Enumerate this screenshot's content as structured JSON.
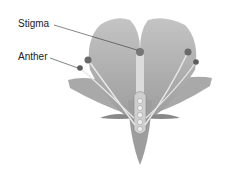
{
  "diagram": {
    "labels": [
      {
        "text": "Stigma",
        "target": "stigma"
      },
      {
        "text": "Anther",
        "target": "anther"
      }
    ]
  }
}
